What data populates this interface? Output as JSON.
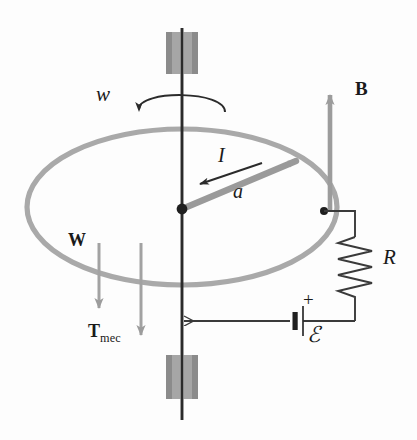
{
  "figure": {
    "canvas": {
      "width": 417,
      "height": 440
    },
    "colors": {
      "background": "#fdfdfd",
      "axis": "#2b2b2b",
      "rail_gray": "#a8a8a8",
      "rod_gray": "#999999",
      "bearing_fill": "#a0a0a0",
      "bearing_edge": "#6e6e6e",
      "field_arrow": "#9c9c9c",
      "force_arrow": "#a0a0a0",
      "wire": "#3a3a3a",
      "label": "#1a1a1a"
    }
  },
  "labels": {
    "angular_velocity": {
      "text": "w",
      "style": "italic",
      "x": 96,
      "y": 95,
      "size": 21
    },
    "magnetic_field": {
      "text": "B",
      "style": "bold",
      "x": 355,
      "y": 89,
      "size": 19
    },
    "current": {
      "text": "I",
      "style": "italic",
      "x": 218,
      "y": 155,
      "size": 20
    },
    "rod_length": {
      "text": "a",
      "style": "italic",
      "x": 233,
      "y": 191,
      "size": 20
    },
    "resistance": {
      "text": "R",
      "style": "italic",
      "x": 383,
      "y": 258,
      "size": 21
    },
    "emf": {
      "text": "ℰ",
      "style": "script",
      "x": 309,
      "y": 330,
      "size": 21
    },
    "battery_plus": {
      "text": "+",
      "style": "plain",
      "x": 305,
      "y": 300,
      "size": 19
    },
    "weight": {
      "text": "W",
      "style": "bold",
      "x": 68,
      "y": 240,
      "size": 18
    },
    "mechanical_torque": {
      "text": "T",
      "subscript": "mec",
      "style": "bold",
      "x": 88,
      "y": 331,
      "size": 18
    }
  },
  "elements": {
    "rotation_axis": {
      "name": "vertical-shaft",
      "x": 182,
      "y_top": 28,
      "y_bottom": 420
    },
    "top_bearing": {
      "name": "top-bearing-block",
      "x": 166,
      "y": 32,
      "width": 32,
      "height": 42
    },
    "bottom_bearing": {
      "name": "bottom-bearing-block",
      "x": 166,
      "y": 355,
      "width": 32,
      "height": 44
    },
    "rotation_arc": {
      "name": "rotation-arc-arrow",
      "cx": 182,
      "cy": 103,
      "rx": 45,
      "ry": 16
    },
    "conducting_rail": {
      "name": "circular-rail-ellipse",
      "cx": 182,
      "cy": 207,
      "rx": 155,
      "ry": 78
    },
    "pivot": {
      "name": "pivot-dot",
      "x": 182,
      "y": 209,
      "r": 5
    },
    "rod": {
      "name": "rotating-rod",
      "x1": 182,
      "y1": 209,
      "x2": 301,
      "y2": 159
    },
    "current_arrow": {
      "name": "current-direction-arrow",
      "x1": 262,
      "y1": 163,
      "x2": 198,
      "y2": 185
    },
    "b_field_arrow": {
      "name": "b-field-arrow",
      "x": 330,
      "y_tail": 212,
      "y_head": 90
    },
    "weight_arrow": {
      "name": "weight-arrow",
      "x": 99,
      "y_tail": 243,
      "y_head": 314
    },
    "torque_arrow": {
      "name": "torque-arrow",
      "x": 141,
      "y_tail": 243,
      "y_head": 341
    },
    "rail_contact": {
      "name": "rail-contact-dot",
      "x": 324,
      "y": 211,
      "r": 4
    },
    "resistor": {
      "name": "resistor-zigzag",
      "x": 355,
      "y_top": 237,
      "y_bottom": 300,
      "zigs": 8
    },
    "battery": {
      "name": "battery-cell",
      "x": 295,
      "y": 321
    },
    "return_wire_arrow": {
      "name": "return-wire-arrowhead",
      "x": 184,
      "y": 321
    }
  }
}
